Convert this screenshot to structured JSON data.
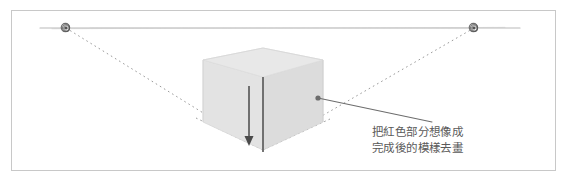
{
  "figure": {
    "background_color": "#ffffff",
    "border_color": "#c8c8c8",
    "border_rect": {
      "x": 11,
      "y": 10,
      "width": 545,
      "height": 161
    }
  },
  "horizon": {
    "label": "horizon-line",
    "color": "#b9b9b9",
    "y": 28,
    "x_start": 40,
    "x_end": 520
  },
  "vanishing_points": [
    {
      "name": "left-vanishing-point",
      "x": 66,
      "y": 28,
      "radius": 4.2,
      "color": "#555555"
    },
    {
      "name": "right-vanishing-point",
      "x": 474,
      "y": 28,
      "radius": 4.2,
      "color": "#555555"
    }
  ],
  "guides": {
    "color": "#9a9a9a",
    "dash": "1.6 3.2",
    "convergence_point": {
      "x": 263,
      "y": 150
    },
    "lines": [
      {
        "name": "guide-left-lower",
        "x1": 66,
        "y1": 28,
        "x2": 263,
        "y2": 150
      },
      {
        "name": "guide-right-lower",
        "x1": 474,
        "y1": 28,
        "x2": 263,
        "y2": 150
      },
      {
        "name": "guide-left-base",
        "x1": 203,
        "y1": 122,
        "x2": 263,
        "y2": 150
      },
      {
        "name": "guide-right-base",
        "x1": 323,
        "y1": 122,
        "x2": 263,
        "y2": 150
      }
    ]
  },
  "box": {
    "name": "perspective-box",
    "fill_color": "#e0e0e0",
    "stroke_color": "#d2d2d2",
    "top_face": [
      {
        "x": 203,
        "y": 60
      },
      {
        "x": 263,
        "y": 48
      },
      {
        "x": 323,
        "y": 60
      },
      {
        "x": 263,
        "y": 77
      }
    ],
    "left_face": [
      {
        "x": 203,
        "y": 60
      },
      {
        "x": 263,
        "y": 77
      },
      {
        "x": 263,
        "y": 150
      },
      {
        "x": 203,
        "y": 122
      }
    ],
    "right_face": [
      {
        "x": 263,
        "y": 77
      },
      {
        "x": 323,
        "y": 60
      },
      {
        "x": 323,
        "y": 122
      },
      {
        "x": 263,
        "y": 150
      }
    ],
    "front_vertical_edge": {
      "x": 263,
      "y1": 77,
      "y2": 152
    }
  },
  "arrow": {
    "name": "downward-direction-arrow",
    "color": "#4a4a4a",
    "x": 249,
    "y_start": 86,
    "y_end": 146,
    "head_width": 9,
    "head_length": 10
  },
  "leader": {
    "name": "callout-leader-line",
    "color": "#6d6d6d",
    "dot": {
      "x": 318,
      "y": 98,
      "radius": 2.6
    },
    "x1": 318,
    "y1": 98,
    "x2": 432,
    "y2": 122
  },
  "annotation": {
    "name": "instruction-note",
    "color": "#5a5a5a",
    "line_1": "把紅色部分想像成",
    "line_2": "完成後的模樣去畫"
  }
}
